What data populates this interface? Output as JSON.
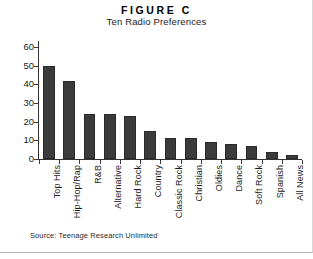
{
  "figure": {
    "title": "FIGURE C",
    "subtitle": "Ten Radio Preferences",
    "source_note": "Source: Teenage Research Unlimited"
  },
  "chart_data": {
    "type": "bar",
    "title": "FIGURE C",
    "subtitle": "Ten Radio Preferences",
    "categories": [
      "Top Hits",
      "Hip-Hop/Rap",
      "R&B",
      "Alternative",
      "Hard Rock",
      "Country",
      "Classic Rock",
      "Christian",
      "Oldies",
      "Dance",
      "Soft Rock",
      "Spanish",
      "All News"
    ],
    "values": [
      50,
      42,
      24,
      24,
      23,
      15,
      11,
      11,
      9,
      8,
      7,
      4,
      2
    ],
    "xlabel": "",
    "ylabel": "",
    "ylim": [
      0,
      60
    ],
    "yticks": [
      0,
      10,
      20,
      30,
      40,
      50,
      60
    ],
    "ytick_labels": [
      "0",
      "10",
      "20",
      "30",
      "40",
      "50",
      "60"
    ],
    "grid": false,
    "legend": false,
    "bar_color": "#3b3b3b",
    "axis_color": "#333333",
    "background": "#ffffff"
  }
}
